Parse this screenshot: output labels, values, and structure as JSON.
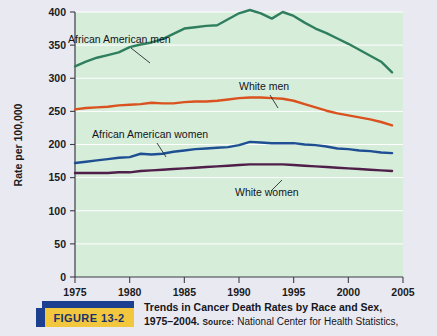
{
  "figure": {
    "badge_label": "FIGURE  13-2",
    "caption_line1": "Trends in Cancer Death Rates by Race and Sex,",
    "caption_years": "1975–2004.",
    "caption_source_label": "Source:",
    "caption_source_text": "National Center for Health Statistics,"
  },
  "colors": {
    "plot_background": "#d6edda",
    "page_background": "#e9e9f1",
    "gridline": "#ffffff",
    "african_american_men": "#2f7f5f",
    "white_men": "#d9521f",
    "african_american_women": "#1f4f93",
    "white_women": "#4f1f4a",
    "badge_blue": "#1d3f8f",
    "badge_gold": "#f2c73d"
  },
  "chart_data": {
    "type": "line",
    "title": "Trends in Cancer Death Rates by Race and Sex, 1975–2004",
    "xlabel": "",
    "ylabel": "Rate per 100,000",
    "xlim": [
      1975,
      2005
    ],
    "ylim": [
      0,
      400
    ],
    "xticks": [
      1975,
      1980,
      1985,
      1990,
      1995,
      2000,
      2005
    ],
    "yticks": [
      0,
      50,
      100,
      150,
      200,
      250,
      300,
      350,
      400
    ],
    "grid": "horizontal",
    "legend": "inline-annotations",
    "x": [
      1975,
      1976,
      1977,
      1978,
      1979,
      1980,
      1981,
      1982,
      1983,
      1984,
      1985,
      1986,
      1987,
      1988,
      1989,
      1990,
      1991,
      1992,
      1993,
      1994,
      1995,
      1996,
      1997,
      1998,
      1999,
      2000,
      2001,
      2002,
      2003,
      2004
    ],
    "series": [
      {
        "name": "African American men",
        "color": "#2f7f5f",
        "values": [
          318,
          325,
          331,
          335,
          339,
          347,
          351,
          354,
          359,
          367,
          375,
          377,
          379,
          380,
          389,
          398,
          403,
          398,
          390,
          400,
          394,
          384,
          375,
          368,
          360,
          352,
          343,
          334,
          325,
          309
        ]
      },
      {
        "name": "White men",
        "color": "#d9521f",
        "values": [
          253,
          255,
          256,
          257,
          259,
          260,
          261,
          263,
          262,
          262,
          264,
          265,
          265,
          266,
          268,
          270,
          271,
          271,
          270,
          269,
          266,
          261,
          256,
          251,
          247,
          244,
          241,
          238,
          234,
          229
        ]
      },
      {
        "name": "African American women",
        "color": "#1f4f93",
        "values": [
          172,
          174,
          176,
          178,
          180,
          181,
          186,
          185,
          186,
          189,
          191,
          193,
          194,
          195,
          196,
          199,
          204,
          203,
          202,
          202,
          202,
          200,
          199,
          197,
          194,
          193,
          191,
          190,
          188,
          187
        ]
      },
      {
        "name": "White women",
        "color": "#4f1f4a",
        "values": [
          157,
          157,
          157,
          157,
          158,
          158,
          160,
          161,
          162,
          163,
          164,
          165,
          166,
          167,
          168,
          169,
          170,
          170,
          170,
          170,
          169,
          168,
          167,
          166,
          165,
          164,
          163,
          162,
          161,
          160
        ]
      }
    ],
    "annotations": [
      {
        "text": "African American men",
        "x_px": 68,
        "y_px": 43
      },
      {
        "text": "White men",
        "x_px": 239,
        "y_px": 90
      },
      {
        "text": "African American women",
        "x_px": 92,
        "y_px": 138
      },
      {
        "text": "White women",
        "x_px": 235,
        "y_px": 196
      }
    ]
  }
}
